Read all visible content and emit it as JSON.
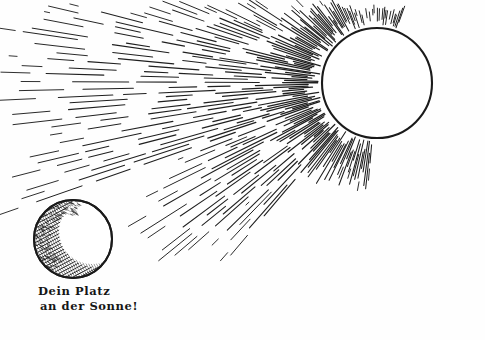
{
  "artwork": {
    "title": "Dein Platz an der Sonne!",
    "style": "pen-and-ink engraving",
    "background_color": "#fefefe",
    "ink_color": "#1a1a1a",
    "canvas": {
      "width": 485,
      "height": 340
    }
  },
  "sun": {
    "label": "sun",
    "center_x": 377,
    "center_y": 83,
    "radius": 55,
    "outline_color": "#1a1a1a",
    "outline_width": 2.1,
    "fill_color": "#ffffff"
  },
  "sphere": {
    "label": "earth-sphere",
    "center_x": 73,
    "center_y": 239,
    "radius": 39,
    "outline_color": "#1a1a1a",
    "outline_width": 2.0,
    "fill_color": "#ffffff",
    "shading": "cross-hatched crescent on left and lower-left limb"
  },
  "rays": {
    "label": "radiating dashed sun rays",
    "origin_x": 377,
    "origin_y": 83,
    "count": 150,
    "angle_start_deg": 95,
    "angle_end_deg": 290,
    "inner_radius": 58,
    "max_length": 420,
    "color": "#1f1f1f"
  },
  "caption": {
    "line_1": "Dein Platz",
    "line_2": "an der Sonne!",
    "font_style": "Fraktur blackletter",
    "color": "#161616"
  }
}
